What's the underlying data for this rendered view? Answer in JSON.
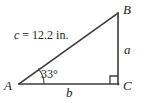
{
  "figure": {
    "type": "right-triangle-diagram",
    "background_color": "#ffffff",
    "stroke_color": "#3c3a3b",
    "text_color": "#221f20"
  },
  "vertices": {
    "a": "A",
    "b": "B",
    "c": "C"
  },
  "sides": {
    "opposite_label": "a",
    "adjacent_label": "b",
    "hypotenuse_variable": "c",
    "hypotenuse_equals": "=",
    "hypotenuse_value": "12.2",
    "hypotenuse_unit": "in.",
    "hypotenuse_text": "c = 12.2 in."
  },
  "angles": {
    "at_a": "33°",
    "at_c": "90°",
    "right_angle_marker": "right-angle-square"
  },
  "geometry": {
    "point_a": [
      19,
      84
    ],
    "point_b": [
      118,
      13
    ],
    "point_c": [
      118,
      84
    ]
  }
}
